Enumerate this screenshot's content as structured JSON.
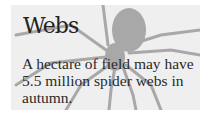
{
  "card": {
    "title": "Webs",
    "text": "A hectare of field may have 5.5 million spider webs in autumn.",
    "background_icon": "spider-icon",
    "colors": {
      "panel": "#efefef",
      "spider": "#a8a8a8",
      "text": "#2a2a2a"
    }
  }
}
